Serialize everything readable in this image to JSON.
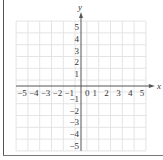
{
  "chart_data": {
    "type": "coordinate-grid",
    "title": "",
    "xlabel": "x",
    "ylabel": "y",
    "xlim": [
      -5,
      5
    ],
    "ylim": [
      -5,
      5
    ],
    "grid": true,
    "x_ticks": [
      "−5",
      "−4",
      "−3",
      "−2",
      "−1",
      "0",
      "1",
      "2",
      "3",
      "4",
      "5"
    ],
    "y_ticks": [
      "5",
      "4",
      "3",
      "2",
      "1",
      "−1",
      "−2",
      "−3",
      "−4",
      "−5"
    ],
    "data_points": []
  },
  "labels": {
    "x_axis": "x",
    "y_axis": "y",
    "origin": "0",
    "x_neg": [
      "−5",
      "−4",
      "−3",
      "−2",
      "−1"
    ],
    "x_pos": [
      "1",
      "2",
      "3",
      "4",
      "5"
    ],
    "y_pos": [
      "1",
      "2",
      "3",
      "4",
      "5"
    ],
    "y_neg": [
      "−1",
      "−2",
      "−3",
      "−4",
      "−5"
    ]
  },
  "colors": {
    "grid": "#e4e4e4",
    "axis": "#555555",
    "text": "#333333"
  }
}
